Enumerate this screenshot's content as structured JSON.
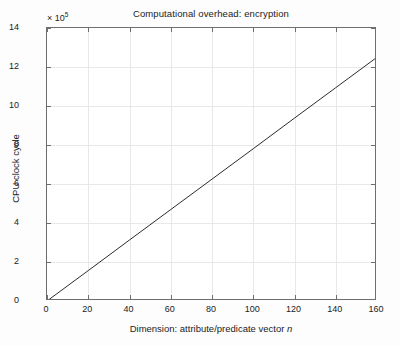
{
  "chart_data": {
    "type": "line",
    "title": "Computational overhead: encryption",
    "xlabel": "Dimension: attribute/predicate vector n",
    "xlabel_plain": "Dimension: attribute/predicate vector ",
    "xlabel_italic": "n",
    "ylabel": "CPU clock cycle",
    "y_multiplier_text": "× 10",
    "y_multiplier_exponent": "5",
    "y_multiplier_value": 100000,
    "xlim": [
      0,
      160
    ],
    "ylim": [
      0,
      14
    ],
    "xticks": [
      0,
      20,
      40,
      60,
      80,
      100,
      120,
      140,
      160
    ],
    "xticklabels": [
      "0",
      "20",
      "40",
      "60",
      "80",
      "100",
      "120",
      "140",
      "160"
    ],
    "yticks": [
      0,
      2,
      4,
      6,
      8,
      10,
      12,
      14
    ],
    "yticklabels": [
      "0",
      "2",
      "4",
      "6",
      "8",
      "10",
      "12",
      "14"
    ],
    "grid": true,
    "legend": null,
    "legend_position": "none",
    "line_color": "#2b2b2b",
    "grid_color": "#e8e8e8",
    "axis_color": "#6e6e6e",
    "background_color": "#ffffff",
    "series": [
      {
        "name": "encryption",
        "style": "solid-thin",
        "x": [
          0,
          20,
          40,
          60,
          80,
          100,
          120,
          140,
          160
        ],
        "y": [
          0.0,
          1.56,
          3.13,
          4.69,
          6.25,
          7.81,
          9.38,
          10.94,
          12.5
        ],
        "y_units_note": "values in units of 1e5 CPU clock cycles",
        "slope_per_unit_n": 7812.5
      }
    ]
  }
}
